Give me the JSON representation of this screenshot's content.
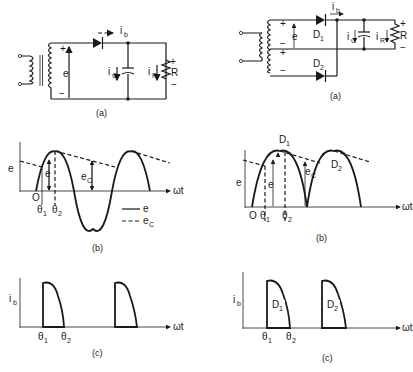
{
  "figure": {
    "left_column": {
      "circuit": {
        "caption": "(a)",
        "labels": {
          "source_emf": "e",
          "plus": "+",
          "minus": "−",
          "diode_current": "i",
          "diode_current_sub": "b",
          "cap_current": "i",
          "cap_current_sub": "C",
          "load_current": "i",
          "load_current_sub": "R",
          "resistor": "R",
          "r_plus": "+",
          "r_minus": "−"
        }
      },
      "waveform": {
        "caption": "(b)",
        "y_label": "e",
        "x_label": "ωt",
        "origin": "O",
        "theta1": "θ",
        "theta1_sub": "1",
        "theta2": "θ",
        "theta2_sub": "2",
        "e_marker": "e",
        "ec_marker": "e",
        "ec_marker_sub": "C",
        "legend": [
          {
            "style": "solid",
            "label": "e",
            "sub": ""
          },
          {
            "style": "dashed",
            "label": "e",
            "sub": "C"
          }
        ]
      },
      "current": {
        "caption": "(c)",
        "y_label": "i",
        "y_label_sub": "b",
        "x_label": "ωt",
        "theta1": "θ",
        "theta1_sub": "1",
        "theta2": "θ",
        "theta2_sub": "2"
      }
    },
    "right_column": {
      "circuit": {
        "caption": "(a)",
        "labels": {
          "source_emf": "e",
          "d1": "D",
          "d1_sub": "1",
          "d2": "D",
          "d2_sub": "2",
          "diode_current": "i",
          "diode_current_sub": "b",
          "cap_current": "i",
          "cap_current_sub": "C",
          "load_current": "i",
          "load_current_sub": "R",
          "resistor": "R",
          "plus": "+",
          "minus": "−"
        }
      },
      "waveform": {
        "caption": "(b)",
        "y_label": "e",
        "x_label": "ωt",
        "origin": "O",
        "theta1": "θ",
        "theta1_sub": "1",
        "theta2": "θ",
        "theta2_sub": "2",
        "e_marker": "e",
        "ec_marker": "e",
        "ec_marker_sub": "C",
        "peak1": "D",
        "peak1_sub": "1",
        "peak2": "D",
        "peak2_sub": "2"
      },
      "current": {
        "caption": "(c)",
        "y_label": "i",
        "y_label_sub": "b",
        "x_label": "ωt",
        "pulse1": "D",
        "pulse1_sub": "1",
        "pulse2": "D",
        "pulse2_sub": "2",
        "theta1": "θ",
        "theta1_sub": "1",
        "theta2": "θ",
        "theta2_sub": "2"
      }
    }
  }
}
